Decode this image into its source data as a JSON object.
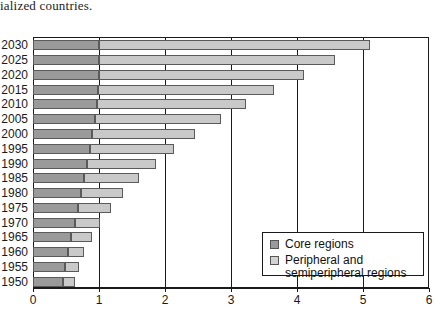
{
  "caption": "ialized countries.",
  "legend": {
    "position": "inside-right",
    "items": [
      {
        "label": "Core regions",
        "color": "#9a9a9a",
        "swatch_name": "legend-swatch-core"
      },
      {
        "label": "Peripheral and\nsemiperipheral regions",
        "color": "#d2d2d2",
        "swatch_name": "legend-swatch-peripheral"
      }
    ]
  },
  "chart_data": {
    "type": "bar",
    "orientation": "horizontal",
    "stacked": true,
    "title": "",
    "xlabel": "",
    "ylabel": "",
    "xlim": [
      0,
      6
    ],
    "ylim": null,
    "grid": true,
    "xticks": [
      "0",
      "1",
      "2",
      "3",
      "4",
      "5",
      "6"
    ],
    "categories": [
      "2030",
      "2025",
      "2020",
      "2015",
      "2010",
      "2005",
      "2000",
      "1995",
      "1990",
      "1985",
      "1980",
      "1975",
      "1970",
      "1965",
      "1960",
      "1955",
      "1950"
    ],
    "series": [
      {
        "name": "Core regions",
        "color": "#9a9a9a",
        "values": [
          1.0,
          1.0,
          1.0,
          0.99,
          0.97,
          0.94,
          0.9,
          0.86,
          0.82,
          0.78,
          0.73,
          0.68,
          0.63,
          0.58,
          0.53,
          0.49,
          0.45
        ]
      },
      {
        "name": "Peripheral and semiperipheral regions",
        "color": "#c9c9c9",
        "values": [
          4.1,
          3.58,
          3.1,
          2.66,
          2.25,
          1.91,
          1.56,
          1.27,
          1.04,
          0.82,
          0.64,
          0.5,
          0.39,
          0.31,
          0.25,
          0.21,
          0.18
        ]
      }
    ],
    "totals": [
      5.1,
      4.58,
      4.1,
      3.65,
      3.22,
      2.85,
      2.46,
      2.13,
      1.86,
      1.6,
      1.37,
      1.18,
      1.02,
      0.89,
      0.78,
      0.7,
      0.63
    ]
  }
}
